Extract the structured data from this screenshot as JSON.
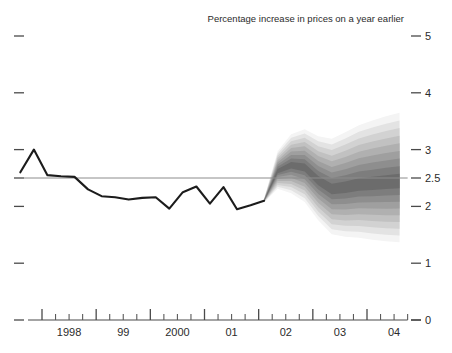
{
  "chart_data": {
    "type": "area",
    "title": "Percentage increase in prices on a year earlier",
    "xlabel": "",
    "ylabel": "",
    "ylim": [
      0,
      5
    ],
    "xlim": [
      1997.5,
      2004.75
    ],
    "grid": false,
    "legend_position": "none",
    "y_ticks": [
      "5",
      "4",
      "3",
      "2.5",
      "2",
      "1",
      "0"
    ],
    "y_tick_values": [
      5,
      4,
      3,
      2.5,
      2,
      1,
      0
    ],
    "x_ticks": [
      "1998",
      "99",
      "2000",
      "01",
      "02",
      "03",
      "04"
    ],
    "x_tick_values": [
      1998,
      1999,
      2000,
      2001,
      2002,
      2003,
      2004
    ],
    "x_minor_ticks_per_year": 4,
    "target_line": {
      "label": "inflation target",
      "value": 2.5,
      "color": "#8c8c8c"
    },
    "series": [
      {
        "name": "History",
        "type": "line",
        "color": "#1c1c1c",
        "x": [
          1997.6,
          1997.85,
          1998.1,
          1998.35,
          1998.6,
          1998.85,
          1999.1,
          1999.35,
          1999.6,
          1999.85,
          2000.1,
          2000.35,
          2000.6,
          2000.85,
          2001.1,
          2001.35,
          2001.6,
          2001.85,
          2002.1
        ],
        "values": [
          2.6,
          3.0,
          2.55,
          2.53,
          2.52,
          2.3,
          2.18,
          2.16,
          2.12,
          2.15,
          2.16,
          1.96,
          2.25,
          2.35,
          2.05,
          2.34,
          1.95,
          2.02,
          2.1
        ]
      },
      {
        "name": "Forecast central projection",
        "type": "line",
        "color": "#4a4a4a",
        "x": [
          2002.1,
          2002.35,
          2002.6,
          2002.85,
          2003.1,
          2003.35,
          2003.6,
          2003.85,
          2004.1,
          2004.35,
          2004.6
        ],
        "values": [
          2.1,
          2.62,
          2.72,
          2.68,
          2.45,
          2.3,
          2.33,
          2.38,
          2.4,
          2.42,
          2.44
        ]
      }
    ],
    "fan_bands": {
      "description": "Probability distribution bands of inflation forecast, darkest at centre",
      "n_bands": 9,
      "band_probability_step": 10,
      "x": [
        2002.1,
        2002.35,
        2002.6,
        2002.85,
        2003.1,
        2003.35,
        2003.6,
        2003.85,
        2004.1,
        2004.35,
        2004.6
      ],
      "central": [
        2.1,
        2.62,
        2.72,
        2.68,
        2.45,
        2.3,
        2.33,
        2.38,
        2.4,
        2.42,
        2.44
      ],
      "half_widths": [
        0.03,
        0.33,
        0.52,
        0.64,
        0.74,
        0.84,
        0.92,
        0.99,
        1.05,
        1.1,
        1.14
      ]
    }
  },
  "colors": {
    "fan_darkest": "#6e6e6e",
    "fan_lightest": "#f0f0f0",
    "axis": "#4a4a4a",
    "text": "#2b2b2b",
    "background": "#ffffff"
  }
}
